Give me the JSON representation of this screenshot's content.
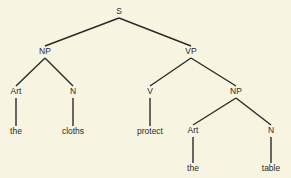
{
  "tree": {
    "nodes": [
      {
        "id": "S",
        "label": "S",
        "parent": null
      },
      {
        "id": "NP1",
        "label": "NP",
        "parent": "S"
      },
      {
        "id": "VP",
        "label": "VP",
        "parent": "S"
      },
      {
        "id": "Art1",
        "label": "Art",
        "parent": "NP1"
      },
      {
        "id": "N1",
        "label": "N",
        "parent": "NP1"
      },
      {
        "id": "the1",
        "label": "the",
        "parent": "Art1"
      },
      {
        "id": "cloths",
        "label": "cloths",
        "parent": "N1"
      },
      {
        "id": "V",
        "label": "V",
        "parent": "VP"
      },
      {
        "id": "NP2",
        "label": "NP",
        "parent": "VP"
      },
      {
        "id": "protect",
        "label": "protect",
        "parent": "V"
      },
      {
        "id": "Art2",
        "label": "Art",
        "parent": "NP2"
      },
      {
        "id": "N2",
        "label": "N",
        "parent": "NP2"
      },
      {
        "id": "the2",
        "label": "the",
        "parent": "Art2"
      },
      {
        "id": "table",
        "label": "table",
        "parent": "N2"
      }
    ]
  }
}
